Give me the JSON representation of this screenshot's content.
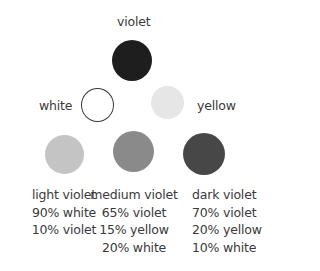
{
  "primaries": {
    "violet": {
      "label": "violet",
      "color": "#1e1e1e"
    },
    "white": {
      "label": "white",
      "color": "#ffffff",
      "border": "#3a3a3a"
    },
    "yellow": {
      "label": "yellow",
      "color": "#e6e6e6"
    }
  },
  "mixes": [
    {
      "name": "light violet",
      "color": "#c4c4c4",
      "lines": [
        "90% white",
        "10% violet"
      ]
    },
    {
      "name": "medium violet",
      "color": "#8a8a8a",
      "lines": [
        "65% violet",
        "15% yellow",
        "20% white"
      ]
    },
    {
      "name": "dark violet",
      "color": "#474747",
      "lines": [
        "70% violet",
        "20% yellow",
        "10% white"
      ]
    }
  ]
}
